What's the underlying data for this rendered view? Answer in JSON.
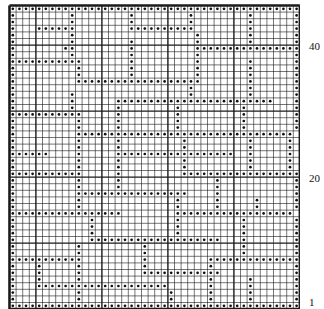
{
  "chart_title": "",
  "grid": {
    "columns": 44,
    "rows": 46,
    "cell_px": 6.6,
    "major_every": 10,
    "line_color": "#1a1a1a",
    "dot_color": "#111111",
    "legend": {
      "o": "dot stitch",
      ".": "blank"
    }
  },
  "row_labels": [
    {
      "row": 1,
      "text": "1"
    },
    {
      "row": 20,
      "text": "20"
    },
    {
      "row": 40,
      "text": "40"
    }
  ],
  "pattern_top_to_bottom": [
    "oooooooooooooooooooooooooooooooooooooooooooo",
    "o........o........o........o........o......o",
    "o........o........o........o........o......o",
    "o...oooooo........oooooooooo........o......o",
    "o........o..................o.......o......o",
    "o........o........o.........o.......o......o",
    "o.......oo........o.........oooooooooooooooo",
    "o........o........o.........o..............o",
    "ooooooooooo.......o.........o.......o......o",
    "o.........o.......o.........o.......o......o",
    "o.........o.......o.........o.......o......o",
    "o.........ooooooooooooooooooo.......o......o",
    "o..........................o........o......o",
    "o........o.................o........o......o",
    "o........o......oooooooooooooooooooooooo...o",
    "o........o......o........o.........o.......o",
    "ooooooooooo.....o........o.........o.......o",
    "o.........o.....o........o.........o.......o",
    "o.........o.....o........o.........o.......o",
    "o.........ooooooooooooooooooooooooooooooooo",
    "o.........o.....o.........o.........o.....o",
    "o.........o.....o.........o.........o.....o",
    "oooooo....o.....oooooooooooooooooo..o.....o",
    "o.........o.....o.........o.........o.....o",
    "o.........o.....o.........o.........o.....o",
    "ooooooooooo.....o.........oooooooooooooooooo",
    "o.........o.....o..............o...........o",
    "o.........o.....o..............o...........o",
    "o.........ooooooooooooooooo....o...........o",
    "o.........o..............o.....o.....o.....o",
    "o.........o..............o.....o.....o.....o",
    "ooooooooooooooooo........oooooooooooooooooo",
    "o...........o............o.........o.......o",
    "o...........o............o.........o.......o",
    "o...........o............o.........o.......o",
    "o...........oooooooooooooooooooo...o.......o",
    "o.........o.........o..............o.......o",
    "o.........o.........o..............o.......o",
    "ooooooooooo.........o.........oooooooooooooo",
    "o...o.....o.........o.........o............o",
    "o...o.....o.........oooooooooooo...........o",
    "o...o.....o...................o.....o......o",
    "o...oooooooooooooooooooo......o.....o......o",
    "o.........o.............o.....o.....o......o",
    "o.........o.............o.....o.....o......o",
    "oooooooooooooooooooooooooooooooooooooooooooo"
  ]
}
